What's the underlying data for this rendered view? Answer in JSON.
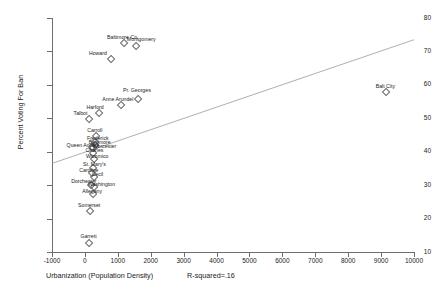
{
  "axes": {
    "y_title": "Percent Voting For Ban",
    "x_title": "Urbanization (Population Density)",
    "r_squared_label": "R-squared=.16",
    "xlim": [
      -1000,
      10000
    ],
    "ylim": [
      10,
      80
    ],
    "xticks": [
      -1000,
      0,
      1000,
      2000,
      3000,
      4000,
      5000,
      6000,
      7000,
      8000,
      9000,
      10000
    ],
    "yticks": [
      10,
      20,
      30,
      40,
      50,
      60,
      70,
      80
    ],
    "xtick_labels": [
      "-1000",
      "0",
      "1000",
      "2000",
      "3000",
      "4000",
      "5000",
      "6000",
      "7000",
      "8000",
      "9000",
      "10000"
    ],
    "ytick_labels": [
      "10",
      "20",
      "30",
      "40",
      "50",
      "60",
      "70",
      "80"
    ]
  },
  "chart_data": {
    "type": "scatter",
    "title": "",
    "xlabel": "Urbanization (Population Density)",
    "ylabel": "Percent Voting For Ban",
    "xlim": [
      -1000,
      10000
    ],
    "ylim": [
      10,
      80
    ],
    "grid": false,
    "legend": "none",
    "annotations": [
      "R-squared=.16"
    ],
    "marker": "open-diamond",
    "point_labels": true,
    "trendline": {
      "type": "linear",
      "x": [
        -1000,
        10000
      ],
      "y": [
        36.5,
        73.5
      ],
      "r_squared": 0.16
    },
    "points": [
      {
        "label": "Baltimore Co.",
        "x": 1150,
        "y": 72.7,
        "label_dx": 0,
        "label_dy": -7
      },
      {
        "label": "Montgomery",
        "x": 1530,
        "y": 72.0,
        "label_dx": 6,
        "label_dy": -8
      },
      {
        "label": "Howard",
        "x": 760,
        "y": 68.1,
        "label_dx": -12,
        "label_dy": -7
      },
      {
        "label": "Balt City",
        "x": 9130,
        "y": 58.2,
        "label_dx": 0,
        "label_dy": -7
      },
      {
        "label": "Pr. Georges",
        "x": 1580,
        "y": 55.9,
        "label_dx": 0,
        "label_dy": -11
      },
      {
        "label": "Anne Arundel",
        "x": 1060,
        "y": 54.3,
        "label_dx": -2,
        "label_dy": -7
      },
      {
        "label": "Harford",
        "x": 400,
        "y": 51.8,
        "label_dx": -3,
        "label_dy": -7
      },
      {
        "label": "Talbot",
        "x": 110,
        "y": 50.2,
        "label_dx": -8,
        "label_dy": -7
      },
      {
        "label": "Carroll",
        "x": 300,
        "y": 45.0,
        "label_dx": 0,
        "label_dy": -7
      },
      {
        "label": "Frederick",
        "x": 270,
        "y": 43.1,
        "label_dx": 4,
        "label_dy": -5.5
      },
      {
        "label": "Baltimore",
        "x": 270,
        "y": 42.3,
        "label_dx": 6,
        "label_dy": -4
      },
      {
        "label": "Queen Anne's",
        "x": 180,
        "y": 41.6,
        "label_dx": -8,
        "label_dy": -3
      },
      {
        "label": "Worcester",
        "x": 230,
        "y": 41.3,
        "label_dx": 12,
        "label_dy": -3
      },
      {
        "label": "Charles",
        "x": 230,
        "y": 39.8,
        "label_dx": 2,
        "label_dy": -4
      },
      {
        "label": "Wicomico",
        "x": 250,
        "y": 38.2,
        "label_dx": 4,
        "label_dy": -4
      },
      {
        "label": "St. Mary's",
        "x": 230,
        "y": 35.3,
        "label_dx": 2,
        "label_dy": -5
      },
      {
        "label": "Caroline",
        "x": 180,
        "y": 33.8,
        "label_dx": -2,
        "label_dy": -4
      },
      {
        "label": "Cecil",
        "x": 260,
        "y": 32.6,
        "label_dx": 4,
        "label_dy": -4
      },
      {
        "label": "Dorchester",
        "x": 150,
        "y": 30.3,
        "label_dx": -6,
        "label_dy": -5
      },
      {
        "label": "Washington",
        "x": 260,
        "y": 29.8,
        "label_dx": 8,
        "label_dy": -4
      },
      {
        "label": "Allegany",
        "x": 220,
        "y": 27.6,
        "label_dx": 0,
        "label_dy": -4
      },
      {
        "label": "Somerset",
        "x": 130,
        "y": 22.5,
        "label_dx": 0,
        "label_dy": -7
      },
      {
        "label": "Garrett",
        "x": 110,
        "y": 13.0,
        "label_dx": 0,
        "label_dy": -8
      }
    ]
  }
}
